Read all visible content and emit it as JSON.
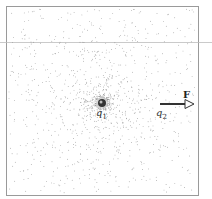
{
  "diagram": {
    "type": "electric field dot density illustration",
    "frame": {
      "x": 6,
      "y": 6,
      "width": 193,
      "height": 190,
      "stroke": "#999999"
    },
    "scan_line": {
      "y": 42,
      "stroke": "#bbbbbb"
    },
    "charges": [
      {
        "id": "q1",
        "label_main": "q",
        "label_sub": "1",
        "x": 102,
        "y": 103
      },
      {
        "id": "q2",
        "label_main": "q",
        "label_sub": "2",
        "x": 160,
        "y": 104
      }
    ],
    "force_vector": {
      "label": "F",
      "from_x": 160,
      "to_x": 193,
      "y": 104,
      "color": "#333333"
    },
    "field_dots_color": "#888888"
  }
}
